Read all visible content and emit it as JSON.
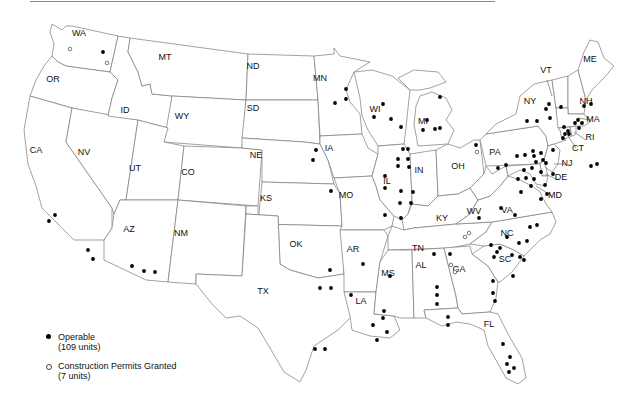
{
  "map": {
    "title": "",
    "state_labels": [
      {
        "abbr": "WA",
        "x": 79,
        "y": 36
      },
      {
        "abbr": "OR",
        "x": 53,
        "y": 82
      },
      {
        "abbr": "CA",
        "x": 36,
        "y": 153
      },
      {
        "abbr": "NV",
        "x": 84,
        "y": 155
      },
      {
        "abbr": "ID",
        "x": 125,
        "y": 113
      },
      {
        "abbr": "MT",
        "x": 165,
        "y": 60
      },
      {
        "abbr": "WY",
        "x": 182,
        "y": 119
      },
      {
        "abbr": "UT",
        "x": 135,
        "y": 171
      },
      {
        "abbr": "CO",
        "x": 188,
        "y": 175
      },
      {
        "abbr": "AZ",
        "x": 129,
        "y": 232
      },
      {
        "abbr": "NM",
        "x": 181,
        "y": 236
      },
      {
        "abbr": "ND",
        "x": 253,
        "y": 69
      },
      {
        "abbr": "SD",
        "x": 253,
        "y": 111
      },
      {
        "abbr": "NE",
        "x": 256,
        "y": 158
      },
      {
        "abbr": "KS",
        "x": 266,
        "y": 201
      },
      {
        "abbr": "OK",
        "x": 296,
        "y": 247
      },
      {
        "abbr": "TX",
        "x": 263,
        "y": 294
      },
      {
        "abbr": "MN",
        "x": 320,
        "y": 81
      },
      {
        "abbr": "IA",
        "x": 329,
        "y": 151
      },
      {
        "abbr": "MO",
        "x": 346,
        "y": 198
      },
      {
        "abbr": "AR",
        "x": 353,
        "y": 252
      },
      {
        "abbr": "LA",
        "x": 361,
        "y": 304
      },
      {
        "abbr": "WI",
        "x": 375,
        "y": 112
      },
      {
        "abbr": "IL",
        "x": 387,
        "y": 184
      },
      {
        "abbr": "MI",
        "x": 423,
        "y": 124
      },
      {
        "abbr": "IN",
        "x": 419,
        "y": 173
      },
      {
        "abbr": "OH",
        "x": 458,
        "y": 169
      },
      {
        "abbr": "KY",
        "x": 442,
        "y": 221
      },
      {
        "abbr": "TN",
        "x": 418,
        "y": 251
      },
      {
        "abbr": "MS",
        "x": 388,
        "y": 276
      },
      {
        "abbr": "AL",
        "x": 421,
        "y": 268
      },
      {
        "abbr": "GA",
        "x": 459,
        "y": 272
      },
      {
        "abbr": "FL",
        "x": 489,
        "y": 327
      },
      {
        "abbr": "SC",
        "x": 505,
        "y": 262
      },
      {
        "abbr": "NC",
        "x": 507,
        "y": 236
      },
      {
        "abbr": "VA",
        "x": 507,
        "y": 213
      },
      {
        "abbr": "WV",
        "x": 474,
        "y": 214
      },
      {
        "abbr": "PA",
        "x": 495,
        "y": 155
      },
      {
        "abbr": "NY",
        "x": 530,
        "y": 104
      },
      {
        "abbr": "VT",
        "x": 546,
        "y": 73
      },
      {
        "abbr": "NH",
        "x": 586,
        "y": 104
      },
      {
        "abbr": "ME",
        "x": 590,
        "y": 62
      },
      {
        "abbr": "MA",
        "x": 593,
        "y": 122
      },
      {
        "abbr": "RI",
        "x": 590,
        "y": 140
      },
      {
        "abbr": "CT",
        "x": 578,
        "y": 151
      },
      {
        "abbr": "NJ",
        "x": 567,
        "y": 166
      },
      {
        "abbr": "DE",
        "x": 561,
        "y": 180
      },
      {
        "abbr": "MD",
        "x": 555,
        "y": 198
      }
    ],
    "operable_dots": [
      [
        103,
        52
      ],
      [
        55,
        215
      ],
      [
        49,
        221
      ],
      [
        88,
        250
      ],
      [
        93,
        259
      ],
      [
        132,
        266
      ],
      [
        144,
        271
      ],
      [
        155,
        272
      ],
      [
        346,
        89
      ],
      [
        346,
        99
      ],
      [
        335,
        103
      ],
      [
        316,
        150
      ],
      [
        313,
        160
      ],
      [
        331,
        191
      ],
      [
        320,
        288
      ],
      [
        331,
        288
      ],
      [
        315,
        349
      ],
      [
        325,
        349
      ],
      [
        383,
        104
      ],
      [
        374,
        117
      ],
      [
        391,
        119
      ],
      [
        401,
        127
      ],
      [
        440,
        97
      ],
      [
        427,
        120
      ],
      [
        423,
        130
      ],
      [
        435,
        129
      ],
      [
        440,
        128
      ],
      [
        403,
        149
      ],
      [
        408,
        149
      ],
      [
        398,
        159
      ],
      [
        408,
        159
      ],
      [
        398,
        166
      ],
      [
        409,
        167
      ],
      [
        385,
        176
      ],
      [
        385,
        188
      ],
      [
        401,
        191
      ],
      [
        413,
        192
      ],
      [
        400,
        203
      ],
      [
        411,
        203
      ],
      [
        385,
        215
      ],
      [
        401,
        218
      ],
      [
        330,
        270
      ],
      [
        363,
        264
      ],
      [
        351,
        295
      ],
      [
        390,
        276
      ],
      [
        384,
        311
      ],
      [
        383,
        318
      ],
      [
        373,
        325
      ],
      [
        387,
        332
      ],
      [
        377,
        340
      ],
      [
        434,
        254
      ],
      [
        450,
        254
      ],
      [
        437,
        287
      ],
      [
        437,
        295
      ],
      [
        437,
        304
      ],
      [
        448,
        317
      ],
      [
        448,
        325
      ],
      [
        501,
        208
      ],
      [
        515,
        215
      ],
      [
        479,
        218
      ],
      [
        507,
        237
      ],
      [
        530,
        227
      ],
      [
        537,
        225
      ],
      [
        519,
        243
      ],
      [
        527,
        241
      ],
      [
        491,
        245
      ],
      [
        497,
        252
      ],
      [
        500,
        248
      ],
      [
        512,
        255
      ],
      [
        520,
        257
      ],
      [
        524,
        260
      ],
      [
        494,
        257
      ],
      [
        513,
        276
      ],
      [
        493,
        281
      ],
      [
        493,
        293
      ],
      [
        495,
        301
      ],
      [
        503,
        344
      ],
      [
        510,
        357
      ],
      [
        507,
        364
      ],
      [
        514,
        368
      ],
      [
        509,
        372
      ],
      [
        476,
        145
      ],
      [
        517,
        156
      ],
      [
        525,
        155
      ],
      [
        534,
        156
      ],
      [
        541,
        153
      ],
      [
        498,
        168
      ],
      [
        506,
        165
      ],
      [
        553,
        150
      ],
      [
        536,
        162
      ],
      [
        543,
        160
      ],
      [
        546,
        163
      ],
      [
        532,
        168
      ],
      [
        541,
        172
      ],
      [
        534,
        179
      ],
      [
        518,
        179
      ],
      [
        526,
        178
      ],
      [
        553,
        174
      ],
      [
        533,
        151
      ],
      [
        524,
        170
      ],
      [
        545,
        185
      ],
      [
        547,
        194
      ],
      [
        531,
        186
      ],
      [
        521,
        192
      ],
      [
        541,
        199
      ],
      [
        549,
        104
      ],
      [
        546,
        109
      ],
      [
        550,
        118
      ],
      [
        527,
        121
      ],
      [
        537,
        121
      ],
      [
        578,
        120
      ],
      [
        564,
        127
      ],
      [
        565,
        134
      ],
      [
        568,
        131
      ],
      [
        569,
        134
      ],
      [
        563,
        138
      ],
      [
        575,
        123
      ],
      [
        582,
        123
      ],
      [
        591,
        104
      ],
      [
        584,
        106
      ],
      [
        561,
        107
      ],
      [
        579,
        128
      ],
      [
        591,
        166
      ],
      [
        597,
        164
      ]
    ],
    "permit_dots": [
      [
        70,
        49
      ],
      [
        107,
        63
      ],
      [
        477,
        152
      ],
      [
        465,
        237
      ],
      [
        469,
        233
      ],
      [
        451,
        265
      ],
      [
        455,
        272
      ]
    ]
  },
  "legend": {
    "items": [
      {
        "symbol": "filled-dot",
        "label": "Operable",
        "sublabel": "(109 units)"
      },
      {
        "symbol": "open-dot",
        "label": "Construction Permits Granted",
        "sublabel": "(7 units)"
      }
    ]
  }
}
